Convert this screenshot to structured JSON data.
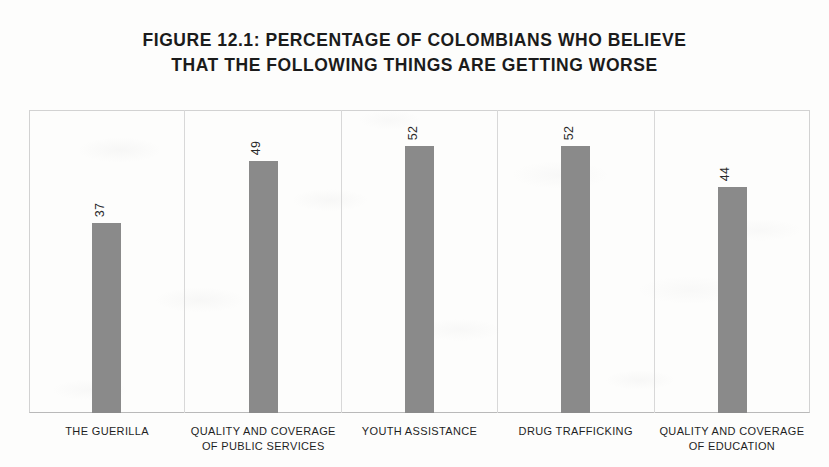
{
  "chart_data": {
    "type": "bar",
    "title": "FIGURE 12.1: PERCENTAGE OF COLOMBIANS WHO BELIEVE THAT THE FOLLOWING THINGS ARE GETTING WORSE",
    "title_lines": [
      "FIGURE 12.1: PERCENTAGE OF COLOMBIANS WHO BELIEVE",
      "THAT THE FOLLOWING THINGS ARE GETTING WORSE"
    ],
    "categories": [
      "THE GUERILLA",
      "QUALITY AND COVERAGE OF PUBLIC SERVICES",
      "YOUTH ASSISTANCE",
      "DRUG TRAFFICKING",
      "QUALITY AND COVERAGE OF EDUCATION"
    ],
    "category_lines": [
      [
        "THE GUERILLA",
        ""
      ],
      [
        "QUALITY AND COVERAGE",
        "OF PUBLIC SERVICES"
      ],
      [
        "YOUTH ASSISTANCE",
        ""
      ],
      [
        "DRUG TRAFFICKING",
        ""
      ],
      [
        "QUALITY AND COVERAGE",
        "OF EDUCATION"
      ]
    ],
    "values": [
      37,
      49,
      52,
      52,
      44
    ],
    "value_labels": [
      "37",
      "49",
      "52",
      "52",
      "44"
    ],
    "xlabel": "",
    "ylabel": "",
    "ylim": [
      0,
      59
    ],
    "grid": false,
    "legend": false,
    "bar_color": "#8a8a8a",
    "value_label_rotation": -90
  }
}
